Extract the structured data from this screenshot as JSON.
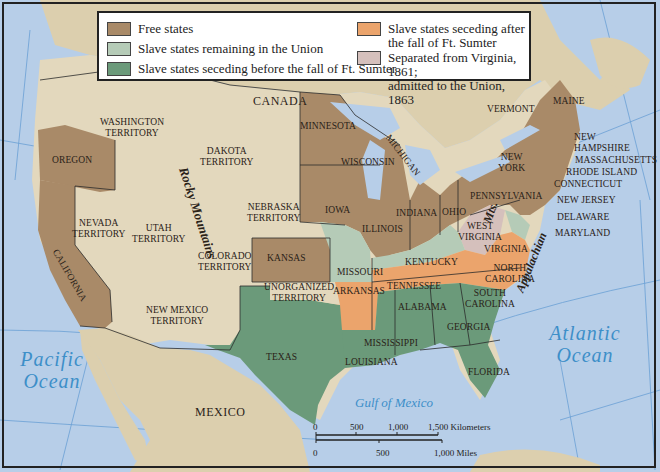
{
  "legend": {
    "items": [
      {
        "label": "Free states",
        "color": "#a98a68"
      },
      {
        "label": "Slave states remaining in the Union",
        "color": "#b5cbb7"
      },
      {
        "label": "Slave states seceding before the fall of Ft. Sumter",
        "color": "#6b9a7a"
      },
      {
        "label": "Slave states seceding after the fall of Ft. Sumter",
        "color": "#eba46c"
      },
      {
        "label": "Separated from Virginia, 1861; admitted to the Union, 1863",
        "color": "#d5c0bc"
      }
    ],
    "item0_label": "Free states",
    "item1_label": "Slave states remaining in the Union",
    "item2_label": "Slave states seceding before the fall of Ft. Sumter",
    "item3_line1": "Slave states seceding after",
    "item3_line2": "the fall of Ft. Sumter",
    "item4_line1": "Separated from Virginia, 1861;",
    "item4_line2": "admitted to the Union, 1863"
  },
  "colors": {
    "free": "#a98a68",
    "slave_union": "#b5cbb7",
    "seceded_before": "#6b9a7a",
    "seceded_after": "#eba46c",
    "west_virginia": "#d5c0bc",
    "territory": "#e3d8bd",
    "ocean": "#b5cde8",
    "border": "#2b2b2b"
  },
  "countries": {
    "canada": "CANADA",
    "mexico": "MEXICO"
  },
  "oceans": {
    "pacific_1": "Pacific",
    "pacific_2": "Ocean",
    "atlantic_1": "Atlantic",
    "atlantic_2": "Ocean",
    "gulf": "Gulf of Mexico"
  },
  "features": {
    "rockies": "Rocky Mountains",
    "appalachian": "Appalachian Mts.",
    "appalachian_a": "Appalachian",
    "appalachian_b": "Mts."
  },
  "territories": {
    "washington_1": "WASHINGTON",
    "washington_2": "TERRITORY",
    "dakota_1": "DAKOTA",
    "dakota_2": "TERRITORY",
    "nebraska_1": "NEBRASKA",
    "nebraska_2": "TERRITORY",
    "nevada_1": "NEVADA",
    "nevada_2": "TERRITORY",
    "utah_1": "UTAH",
    "utah_2": "TERRITORY",
    "colorado_1": "COLORADO",
    "colorado_2": "TERRITORY",
    "new_mexico_1": "NEW MEXICO",
    "new_mexico_2": "TERRITORY",
    "unorganized_1": "UNORGANIZED",
    "unorganized_2": "TERRITORY"
  },
  "states": {
    "oregon": "OREGON",
    "california": "CALIFORNIA",
    "kansas": "KANSAS",
    "minnesota": "MINNESOTA",
    "iowa": "IOWA",
    "wisconsin": "WISCONSIN",
    "michigan": "MICHIGAN",
    "illinois": "ILLINOIS",
    "indiana": "INDIANA",
    "ohio": "OHIO",
    "pennsylvania": "PENNSYLVANIA",
    "new_york_1": "NEW",
    "new_york_2": "YORK",
    "vermont": "VERMONT",
    "maine": "MAINE",
    "new_hampshire_1": "NEW",
    "new_hampshire_2": "HAMPSHIRE",
    "massachusetts": "MASSACHUSETTS",
    "rhode_island": "RHODE ISLAND",
    "connecticut": "CONNECTICUT",
    "new_jersey": "NEW JERSEY",
    "delaware": "DELAWARE",
    "maryland": "MARYLAND",
    "west_virginia_1": "WEST",
    "west_virginia_2": "VIRGINIA",
    "virginia": "VIRGINIA",
    "north_carolina_1": "NORTH",
    "north_carolina_2": "CAROLINA",
    "south_carolina_1": "SOUTH",
    "south_carolina_2": "CAROLINA",
    "kentucky": "KENTUCKY",
    "missouri": "MISSOURI",
    "tennessee": "TENNESSEE",
    "arkansas": "ARKANSAS",
    "alabama": "ALABAMA",
    "georgia": "GEORGIA",
    "mississippi": "MISSISSIPPI",
    "louisiana": "LOUISIANA",
    "texas": "TEXAS",
    "florida": "FLORIDA"
  },
  "rivers": {
    "missouri": "Missouri R.",
    "colorado": "Colorado R.",
    "ohio": "Ohio R.",
    "mississippi": "Mississippi R.",
    "hudson": "Hudson R."
  },
  "scale": {
    "km_ticks": [
      "0",
      "500",
      "1,000",
      "1,500 Kilometers"
    ],
    "mi_ticks": [
      "0",
      "500",
      "1,000 Miles"
    ]
  }
}
